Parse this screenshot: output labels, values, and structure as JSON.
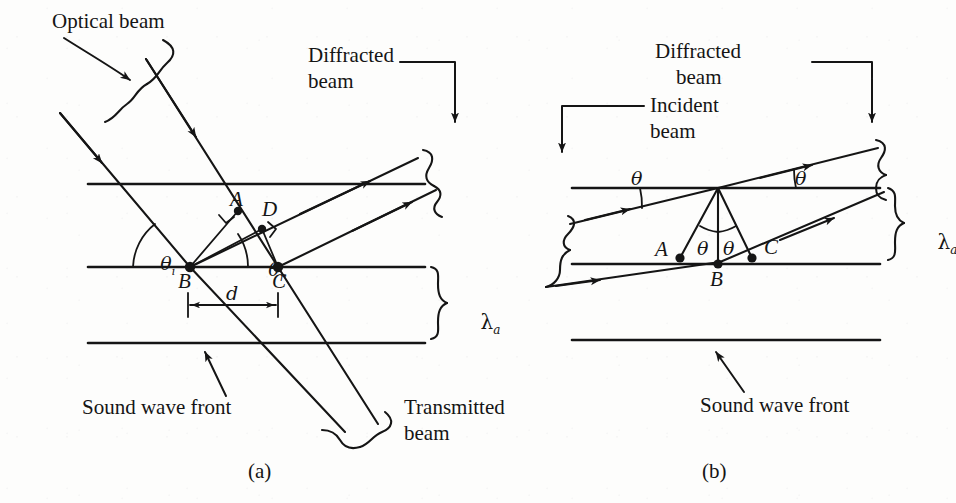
{
  "figure": {
    "background_color": "#fdfdfc",
    "ink_color": "#151515"
  },
  "panels": [
    {
      "id": "a",
      "caption": "(a)",
      "labels": {
        "optical_beam": "Optical beam",
        "diffracted_beam_line1": "Diffracted",
        "diffracted_beam_line2": "beam",
        "transmitted_beam_line1": "Transmitted",
        "transmitted_beam_line2": "beam",
        "sound_wave_front": "Sound wave front"
      },
      "points": [
        "A",
        "D",
        "B",
        "C"
      ],
      "angles": [
        {
          "symbol": "θ",
          "subscript": "i",
          "name": "incidence-angle"
        },
        {
          "symbol": "θ",
          "subscript": "r",
          "name": "reflection-angle"
        }
      ],
      "dimensions": [
        {
          "symbol": "d",
          "name": "spacing-d"
        },
        {
          "symbol": "λ",
          "subscript": "a",
          "name": "acoustic-wavelength"
        }
      ],
      "wave_front_count": 3
    },
    {
      "id": "b",
      "caption": "(b)",
      "labels": {
        "incident_beam_line1": "Incident",
        "incident_beam_line2": "beam",
        "diffracted_beam_line1": "Diffracted",
        "diffracted_beam_line2": "beam",
        "sound_wave_front": "Sound wave front"
      },
      "points": [
        "A",
        "B",
        "C"
      ],
      "angles": [
        {
          "symbol": "θ",
          "subscript": "",
          "name": "upper-left-theta"
        },
        {
          "symbol": "θ",
          "subscript": "",
          "name": "upper-right-theta"
        },
        {
          "symbol": "θ",
          "subscript": "",
          "name": "lower-left-theta"
        },
        {
          "symbol": "θ",
          "subscript": "",
          "name": "lower-right-theta"
        }
      ],
      "dimensions": [
        {
          "symbol": "λ",
          "subscript": "a",
          "name": "acoustic-wavelength"
        }
      ],
      "wave_front_count": 3
    }
  ]
}
